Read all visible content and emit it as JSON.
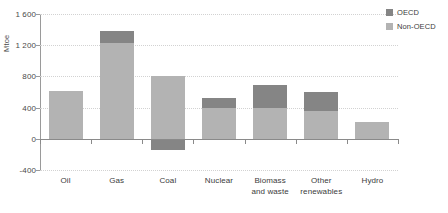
{
  "chart_data": {
    "type": "bar",
    "title": "",
    "subtitle": "",
    "xlabel": "",
    "ylabel": "Mtoe",
    "stacked": true,
    "orientation": "vertical",
    "grid": true,
    "legend_position": "top-right",
    "ylim": [
      -400,
      1600
    ],
    "ytick_labels": [
      "1 600",
      "1 200",
      "800",
      "400",
      "0",
      "-400"
    ],
    "ytick_values": [
      1600,
      1200,
      800,
      400,
      0,
      -400
    ],
    "categories": [
      "Oil",
      "Gas",
      "Coal",
      "Nuclear",
      "Biomass and waste",
      "Other renewables",
      "Hydro"
    ],
    "category_lines": [
      [
        "Oil"
      ],
      [
        "Gas"
      ],
      [
        "Coal"
      ],
      [
        "Nuclear"
      ],
      [
        "Biomass",
        "and waste"
      ],
      [
        "Other",
        "renewables"
      ],
      [
        "Hydro"
      ]
    ],
    "series": [
      {
        "name": "Non-OECD",
        "color": "#b3b3b3",
        "values": [
          610,
          1230,
          800,
          400,
          400,
          360,
          220
        ]
      },
      {
        "name": "OECD",
        "color": "#858585",
        "values": [
          0,
          150,
          -150,
          120,
          290,
          240,
          0
        ]
      }
    ],
    "totals": [
      610,
      1380,
      650,
      520,
      690,
      600,
      220
    ]
  },
  "legend": {
    "items": [
      {
        "label": "OECD",
        "color": "#858585"
      },
      {
        "label": "Non-OECD",
        "color": "#b3b3b3"
      }
    ]
  },
  "axis": {
    "y_title": "Mtoe"
  }
}
